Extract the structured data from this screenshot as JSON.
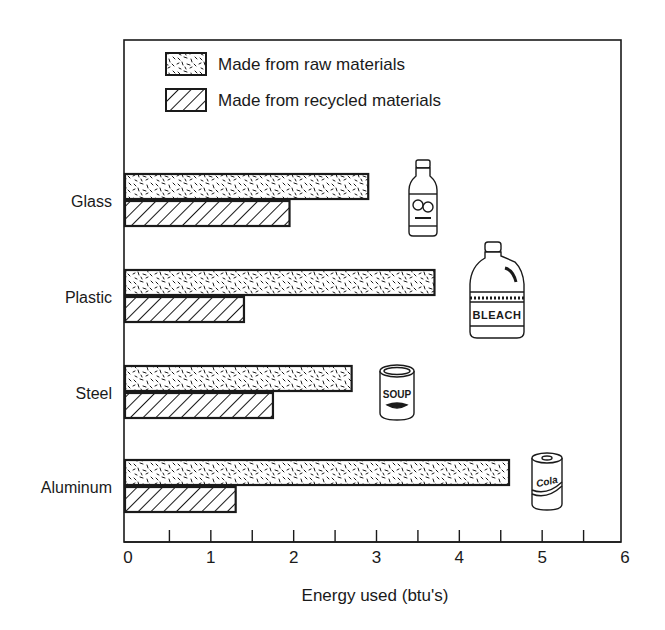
{
  "chart_data": {
    "type": "bar",
    "orientation": "horizontal",
    "title": "",
    "xlabel": "Energy used (btu's)",
    "ylabel": "",
    "categories": [
      "Glass",
      "Plastic",
      "Steel",
      "Aluminum"
    ],
    "series": [
      {
        "name": "Made from raw materials",
        "pattern": "speckled",
        "values": [
          2.9,
          3.7,
          2.7,
          4.6
        ]
      },
      {
        "name": "Made from recycled materials",
        "pattern": "diagonal-hatch",
        "values": [
          1.95,
          1.4,
          1.75,
          1.3
        ]
      }
    ],
    "xlim": [
      0,
      6
    ],
    "x_ticks": [
      0,
      1,
      2,
      3,
      4,
      5,
      6
    ],
    "x_minor_step": 0.5,
    "grid": false,
    "legend_position": "top-left inside",
    "icons": [
      {
        "category": "Glass",
        "name": "juice-bottle-icon",
        "label": ""
      },
      {
        "category": "Plastic",
        "name": "bleach-jug-icon",
        "label": "BLEACH"
      },
      {
        "category": "Steel",
        "name": "soup-can-icon",
        "label": "SOUP"
      },
      {
        "category": "Aluminum",
        "name": "cola-can-icon",
        "label": "Cola"
      }
    ]
  },
  "colors": {
    "ink": "#1a1a1a",
    "background": "#ffffff"
  }
}
